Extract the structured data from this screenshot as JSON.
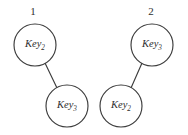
{
  "figure": {
    "background_color": "#ffffff",
    "stroke_color": "#3c3c3c",
    "text_color": "#2e2e2e",
    "width": 188,
    "height": 135
  },
  "diagrams": [
    {
      "caption": "1",
      "caption_x": 33,
      "caption_y": 12,
      "nodes": [
        {
          "id": "d1-n1",
          "base": "Key",
          "subscript": "2",
          "cx": 35,
          "cy": 45,
          "r": 21
        },
        {
          "id": "d1-n2",
          "base": "Key",
          "subscript": "3",
          "cx": 67,
          "cy": 106,
          "r": 21
        }
      ],
      "edges": [
        {
          "x1": 45,
          "y1": 63,
          "x2": 57,
          "y2": 88
        }
      ]
    },
    {
      "caption": "2",
      "caption_x": 151,
      "caption_y": 12,
      "nodes": [
        {
          "id": "d2-n1",
          "base": "Key",
          "subscript": "3",
          "cx": 152,
          "cy": 45,
          "r": 21
        },
        {
          "id": "d2-n2",
          "base": "Key",
          "subscript": "2",
          "cx": 121,
          "cy": 106,
          "r": 21
        }
      ],
      "edges": [
        {
          "x1": 142,
          "y1": 63,
          "x2": 131,
          "y2": 88
        }
      ]
    }
  ]
}
